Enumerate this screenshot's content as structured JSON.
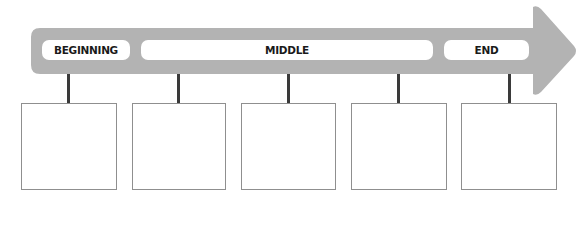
{
  "diagram": {
    "type": "timeline-arrow",
    "colors": {
      "arrow": "#b3b3b3",
      "label_bg": "#ffffff",
      "stem": "#3a3a3a",
      "box_border": "#8f8f8f"
    },
    "labels": [
      {
        "id": "beginning",
        "text": "BEGINNING"
      },
      {
        "id": "middle",
        "text": "MIDDLE"
      },
      {
        "id": "end",
        "text": "END"
      }
    ],
    "boxes": [
      {
        "index": 1,
        "text": ""
      },
      {
        "index": 2,
        "text": ""
      },
      {
        "index": 3,
        "text": ""
      },
      {
        "index": 4,
        "text": ""
      },
      {
        "index": 5,
        "text": ""
      }
    ]
  }
}
